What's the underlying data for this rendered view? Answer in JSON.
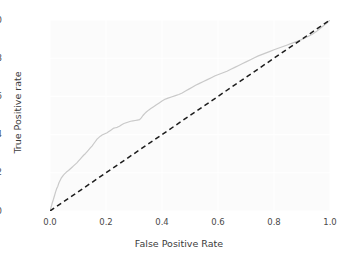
{
  "chart_data": {
    "type": "line",
    "title": "",
    "xlabel": "False Positive Rate",
    "ylabel": "True Positive rate",
    "xlim": [
      0.0,
      1.0
    ],
    "ylim": [
      0.0,
      1.0
    ],
    "grid": true,
    "legend": "none",
    "xticks": [
      "0.0",
      "0.2",
      "0.4",
      "0.6",
      "0.8",
      "1.0"
    ],
    "xtick_values": [
      0.0,
      0.2,
      0.4,
      0.6,
      0.8,
      1.0
    ],
    "yticks": [
      "0.0",
      "0.2",
      "0.4",
      "0.6",
      "0.8",
      "1.0"
    ],
    "ytick_values": [
      0.0,
      0.2,
      0.4,
      0.6,
      0.8,
      1.0
    ],
    "series": [
      {
        "name": "ROC curve",
        "style": "solid",
        "color": "#c9c9c9",
        "linewidth": 1.2,
        "x": [
          0.0,
          0.004,
          0.008,
          0.012,
          0.016,
          0.02,
          0.024,
          0.028,
          0.032,
          0.036,
          0.04,
          0.044,
          0.048,
          0.052,
          0.056,
          0.06,
          0.066,
          0.072,
          0.078,
          0.084,
          0.09,
          0.096,
          0.102,
          0.108,
          0.114,
          0.12,
          0.126,
          0.132,
          0.138,
          0.144,
          0.15,
          0.156,
          0.162,
          0.168,
          0.174,
          0.18,
          0.186,
          0.192,
          0.198,
          0.204,
          0.21,
          0.216,
          0.222,
          0.228,
          0.234,
          0.24,
          0.248,
          0.256,
          0.264,
          0.272,
          0.28,
          0.288,
          0.296,
          0.304,
          0.312,
          0.32,
          0.326,
          0.332,
          0.338,
          0.344,
          0.352,
          0.36,
          0.37,
          0.38,
          0.39,
          0.4,
          0.412,
          0.424,
          0.436,
          0.448,
          0.46,
          0.472,
          0.484,
          0.496,
          0.508,
          0.52,
          0.534,
          0.548,
          0.562,
          0.576,
          0.59,
          0.604,
          0.618,
          0.632,
          0.646,
          0.66,
          0.674,
          0.688,
          0.702,
          0.716,
          0.73,
          0.744,
          0.758,
          0.772,
          0.786,
          0.8,
          0.815,
          0.83,
          0.845,
          0.86,
          0.875,
          0.89,
          0.905,
          0.92,
          0.935,
          0.95,
          0.96,
          0.97,
          0.98,
          0.99,
          1.0
        ],
        "y": [
          0.0,
          0.02,
          0.042,
          0.06,
          0.08,
          0.1,
          0.118,
          0.13,
          0.148,
          0.16,
          0.172,
          0.18,
          0.188,
          0.194,
          0.2,
          0.206,
          0.212,
          0.22,
          0.228,
          0.236,
          0.244,
          0.252,
          0.262,
          0.272,
          0.282,
          0.292,
          0.3,
          0.31,
          0.32,
          0.33,
          0.34,
          0.352,
          0.364,
          0.376,
          0.384,
          0.392,
          0.398,
          0.402,
          0.406,
          0.41,
          0.416,
          0.422,
          0.428,
          0.434,
          0.436,
          0.438,
          0.444,
          0.452,
          0.458,
          0.462,
          0.466,
          0.47,
          0.472,
          0.474,
          0.476,
          0.478,
          0.488,
          0.5,
          0.51,
          0.518,
          0.528,
          0.536,
          0.546,
          0.556,
          0.566,
          0.576,
          0.586,
          0.592,
          0.598,
          0.604,
          0.61,
          0.618,
          0.628,
          0.638,
          0.648,
          0.658,
          0.668,
          0.678,
          0.688,
          0.698,
          0.708,
          0.716,
          0.724,
          0.732,
          0.742,
          0.752,
          0.762,
          0.772,
          0.782,
          0.792,
          0.802,
          0.812,
          0.82,
          0.828,
          0.836,
          0.844,
          0.852,
          0.86,
          0.868,
          0.876,
          0.884,
          0.892,
          0.902,
          0.912,
          0.924,
          0.938,
          0.95,
          0.962,
          0.974,
          0.986,
          1.0
        ]
      },
      {
        "name": "Chance level",
        "style": "dashed",
        "color": "#1c1c1c",
        "linewidth": 1.5,
        "x": [
          0.0,
          1.0
        ],
        "y": [
          0.0,
          1.0
        ]
      }
    ]
  },
  "colors": {
    "figure_background": "#ffffff",
    "axes_background": "#fbfbfb",
    "grid": "#ffffff",
    "tick_label": "#4a4a4a",
    "axis_label": "#3c3c3c",
    "roc_curve": "#c9c9c9",
    "chance_line": "#1c1c1c"
  }
}
